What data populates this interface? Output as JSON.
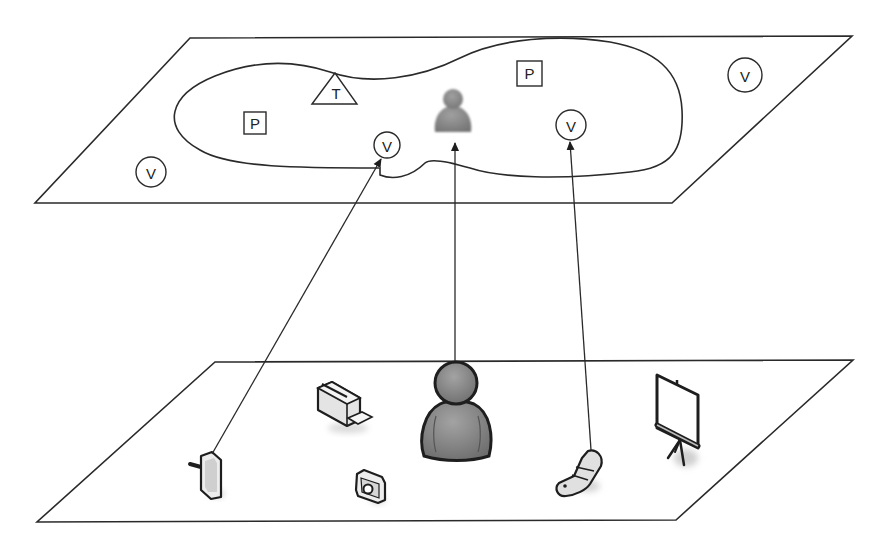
{
  "diagram": {
    "colors": {
      "line": "#2a2a2a",
      "person_fill": "#8a8a8a",
      "person_outline": "#1e1e1e",
      "device_fill": "#e6e6e6",
      "shadow": "#d0d0d0"
    },
    "top_plane": {
      "label": "virtual-layer",
      "symbols": [
        {
          "id": "v-outer-left",
          "shape": "circle",
          "label": "V"
        },
        {
          "id": "p-left",
          "shape": "square",
          "label": "P"
        },
        {
          "id": "t-top",
          "shape": "triangle",
          "label": "T"
        },
        {
          "id": "v-mid",
          "shape": "circle",
          "label": "V"
        },
        {
          "id": "p-right",
          "shape": "square",
          "label": "P"
        },
        {
          "id": "v-right",
          "shape": "circle",
          "label": "V"
        },
        {
          "id": "v-outer-right",
          "shape": "circle",
          "label": "V"
        }
      ],
      "avatar": "person-icon"
    },
    "bottom_plane": {
      "label": "physical-layer",
      "devices": [
        {
          "id": "pda",
          "icon": "pda-icon"
        },
        {
          "id": "printer",
          "icon": "printer-icon"
        },
        {
          "id": "person",
          "icon": "person-icon"
        },
        {
          "id": "camera",
          "icon": "camera-icon"
        },
        {
          "id": "phone",
          "icon": "mobile-phone-icon"
        },
        {
          "id": "projector-screen",
          "icon": "projector-screen-icon"
        }
      ]
    },
    "mappings": [
      {
        "from": "pda",
        "to": "v-mid"
      },
      {
        "from": "person",
        "to": "avatar"
      },
      {
        "from": "phone",
        "to": "v-right"
      }
    ]
  }
}
